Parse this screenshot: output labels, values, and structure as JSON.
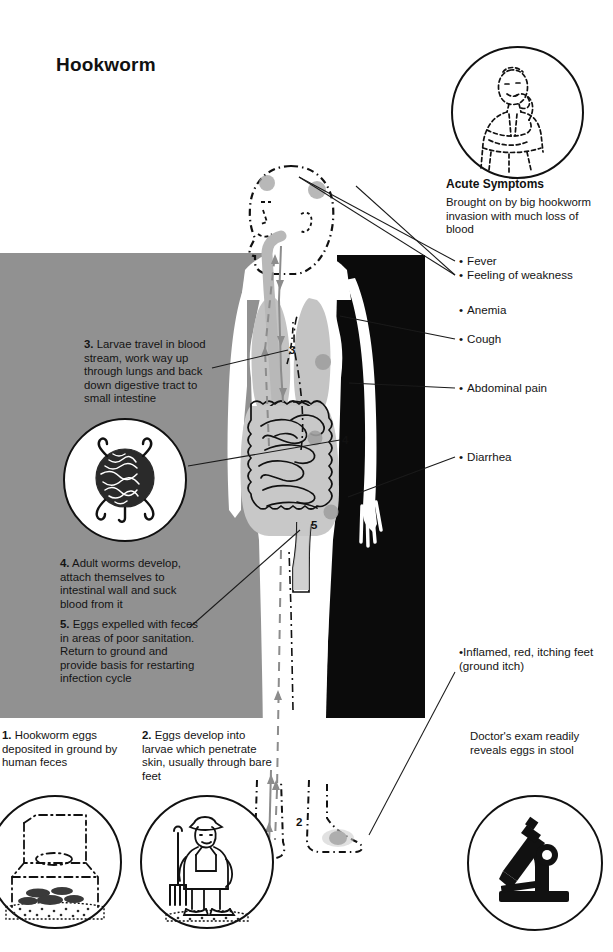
{
  "page": {
    "title": "Hookworm",
    "background": "#ffffff",
    "panel_gray_color": "#919191",
    "panel_black_color": "#0b0b0b",
    "ink_color": "#111111"
  },
  "symptoms_panel": {
    "heading": "Acute Symptoms",
    "subtitle": "Brought on by big hookworm invasion with much loss of blood",
    "items": [
      {
        "label": "Fever"
      },
      {
        "label": "Feeling of weakness"
      },
      {
        "label": "Anemia"
      },
      {
        "label": "Cough"
      },
      {
        "label": "Abdominal pain"
      },
      {
        "label": "Diarrhea"
      }
    ],
    "foot_symptom": "Inflamed, red, itching feet (ground itch)",
    "doctor_note": "Doctor's exam readily reveals eggs in stool"
  },
  "steps": [
    {
      "number": "1.",
      "text": "Hookworm eggs deposited in ground by human feces"
    },
    {
      "number": "2.",
      "text": "Eggs develop into larvae which penetrate skin, usually through bare feet"
    },
    {
      "number": "3.",
      "text": "Larvae travel in blood stream, work way up through lungs and back down digestive tract to small intestine"
    },
    {
      "number": "4.",
      "text": "Adult worms develop, attach themselves to intestinal wall and suck blood from it"
    },
    {
      "number": "5.",
      "text": "Eggs expelled with feces in areas of poor sanitation. Return to ground and provide basis for restarting infection cycle"
    }
  ],
  "body_markers": {
    "m3": "3",
    "m4": "4",
    "m5": "5",
    "m2": "2"
  },
  "illustrations": {
    "cough": "coughing-man-icon",
    "worms": "worm-cluster-icon",
    "outhouse": "outhouse-feces-icon",
    "farmer": "barefoot-farmer-icon",
    "microscope": "microscope-icon",
    "body": "human-body-anatomy-diagram"
  }
}
